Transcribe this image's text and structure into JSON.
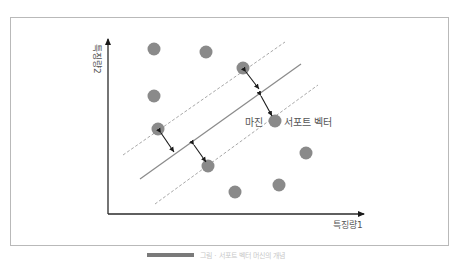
{
  "diagram": {
    "x_axis_label": "특징량1",
    "y_axis_label": "특징량2",
    "margin_label": "마진",
    "support_vector_label": "서포트 벡터",
    "colors": {
      "point": "#8a8a8a",
      "hyperplane": "#8c8c8c",
      "margin_line": "#a8a8a8",
      "axis": "#2a2a2a",
      "arrow": "#1a1a1a",
      "frame": "#b9b9b9"
    },
    "points": [
      {
        "x": 154,
        "y": 49,
        "role": "class-a"
      },
      {
        "x": 206,
        "y": 52,
        "role": "class-a"
      },
      {
        "x": 154,
        "y": 96,
        "role": "class-a"
      },
      {
        "x": 243,
        "y": 68,
        "role": "support-vector-a"
      },
      {
        "x": 158,
        "y": 129,
        "role": "support-vector-a"
      },
      {
        "x": 275,
        "y": 121,
        "role": "support-vector-b"
      },
      {
        "x": 208,
        "y": 166,
        "role": "support-vector-b"
      },
      {
        "x": 235,
        "y": 192,
        "role": "class-b"
      },
      {
        "x": 279,
        "y": 185,
        "role": "class-b"
      },
      {
        "x": 306,
        "y": 153,
        "role": "class-b"
      }
    ]
  },
  "caption": {
    "text": "그림 · 서포트 벡터 머신의 개념"
  }
}
